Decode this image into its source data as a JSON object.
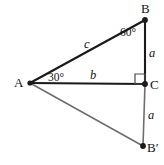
{
  "figure": {
    "background_color": "#ffffff",
    "stroke_color_primary": "#1a1a1a",
    "stroke_color_secondary": "#6e6e6e",
    "vertices": [
      {
        "id": "A",
        "label": "A",
        "x": 30,
        "y": 83,
        "label_x": 14,
        "label_y": 76,
        "dot": true
      },
      {
        "id": "B",
        "label": "B",
        "x": 145,
        "y": 20,
        "label_x": 141,
        "label_y": 2,
        "dot": true
      },
      {
        "id": "C",
        "label": "C",
        "x": 145,
        "y": 84,
        "label_x": 150,
        "label_y": 78,
        "dot": true
      },
      {
        "id": "Bp",
        "label": "B′",
        "x": 143,
        "y": 146,
        "label_x": 148,
        "label_y": 141,
        "dot": true
      }
    ],
    "segments": [
      {
        "id": "AB",
        "from": "A",
        "to": "B",
        "weight": "heavy"
      },
      {
        "id": "AC",
        "from": "A",
        "to": "C",
        "weight": "heavy"
      },
      {
        "id": "BC",
        "from": "B",
        "to": "C",
        "weight": "heavy"
      },
      {
        "id": "ABp",
        "from": "A",
        "to": "Bp",
        "weight": "light"
      },
      {
        "id": "CBp",
        "from": "C",
        "to": "Bp",
        "weight": "light"
      }
    ],
    "side_labels": [
      {
        "id": "side-c",
        "text": "c",
        "x": 84,
        "y": 38,
        "segment": "AB"
      },
      {
        "id": "side-b",
        "text": "b",
        "x": 90,
        "y": 69,
        "segment": "AC"
      },
      {
        "id": "side-a-upper",
        "text": "a",
        "x": 149,
        "y": 47,
        "segment": "BC"
      },
      {
        "id": "side-a-lower",
        "text": "a",
        "x": 148,
        "y": 109,
        "segment": "CBp"
      }
    ],
    "angle_labels": [
      {
        "id": "angle-a",
        "text": "30°",
        "x": 48,
        "y": 72,
        "vertex": "A"
      },
      {
        "id": "angle-b",
        "text": "60°",
        "x": 120,
        "y": 27,
        "vertex": "B"
      }
    ],
    "right_angle": {
      "id": "right-angle-c",
      "vertex": "C",
      "x": 135,
      "y": 74,
      "size": 10
    }
  }
}
